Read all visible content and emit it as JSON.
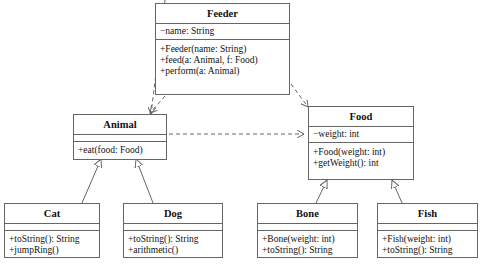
{
  "diagram": {
    "type": "UML class diagram",
    "classes": {
      "feeder": {
        "name": "Feeder",
        "attributes": [
          "−name: String"
        ],
        "operations": [
          "+Feeder(name: String)",
          "+feed(a: Animal, f: Food)",
          "+perform(a: Animal)"
        ]
      },
      "animal": {
        "name": "Animal",
        "attributes": [],
        "operations": [
          "+eat(food: Food)"
        ]
      },
      "food": {
        "name": "Food",
        "attributes": [
          "−weight: int"
        ],
        "operations": [
          "+Food(weight: int)",
          "+getWeight(): int"
        ]
      },
      "cat": {
        "name": "Cat",
        "attributes": [],
        "operations": [
          "+toString(): String",
          "+jumpRing()"
        ]
      },
      "dog": {
        "name": "Dog",
        "attributes": [],
        "operations": [
          "+toString(): String",
          "+arithmetic()"
        ]
      },
      "bone": {
        "name": "Bone",
        "attributes": [],
        "operations": [
          "+Bone(weight: int)",
          "+toString(): String"
        ]
      },
      "fish": {
        "name": "Fish",
        "attributes": [],
        "operations": [
          "+Fish(weight: int)",
          "+toString(): String"
        ]
      }
    },
    "relationships": [
      {
        "from": "Feeder",
        "to": "Animal",
        "kind": "dependency"
      },
      {
        "from": "Feeder",
        "to": "Food",
        "kind": "dependency"
      },
      {
        "from": "Animal",
        "to": "Food",
        "kind": "dependency"
      },
      {
        "from": "Cat",
        "to": "Animal",
        "kind": "generalization"
      },
      {
        "from": "Dog",
        "to": "Animal",
        "kind": "generalization"
      },
      {
        "from": "Bone",
        "to": "Food",
        "kind": "generalization"
      },
      {
        "from": "Fish",
        "to": "Food",
        "kind": "generalization"
      }
    ],
    "colors": {
      "line": "#666666",
      "text": "#111111",
      "background": "#ffffff"
    }
  }
}
